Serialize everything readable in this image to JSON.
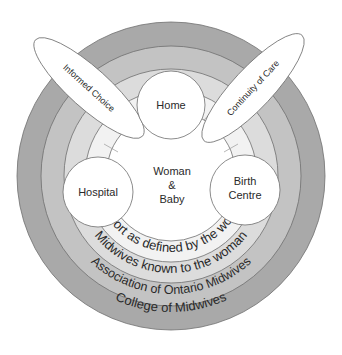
{
  "diagram": {
    "center": {
      "line1": "Woman",
      "line2": "&",
      "line3": "Baby"
    },
    "rings": [
      {
        "label": "Support as defined by the woman",
        "color": "#f2f2f2"
      },
      {
        "label": "Midwives known to the woman",
        "color": "#dcdcdc"
      },
      {
        "label": "Association of Ontario Midwives",
        "color": "#c3c3c3"
      },
      {
        "label": "College of Midwives",
        "color": "#a9a9a9"
      }
    ],
    "places": [
      {
        "label": "Home"
      },
      {
        "label": "Hospital"
      },
      {
        "label_line1": "Birth",
        "label_line2": "Centre"
      }
    ],
    "principles": [
      {
        "label": "Informed Choice"
      },
      {
        "label": "Continuity of Care"
      }
    ]
  }
}
